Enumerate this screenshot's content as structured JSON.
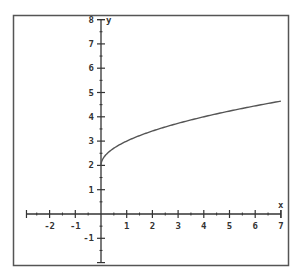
{
  "chart_data": {
    "type": "line",
    "title": "",
    "function": "y = sqrt(x) + 2",
    "xlabel": "x",
    "ylabel": "y",
    "xlim": [
      -2.9,
      7
    ],
    "ylim": [
      -2,
      8
    ],
    "x_ticks": [
      -2,
      -1,
      1,
      2,
      3,
      4,
      5,
      6,
      7
    ],
    "x_tick_labels": [
      "-2",
      "-1",
      "1",
      "2",
      "3",
      "4",
      "5",
      "6",
      "7"
    ],
    "y_ticks": [
      -1,
      1,
      2,
      3,
      4,
      5,
      6,
      7,
      8
    ],
    "y_tick_labels": [
      "-1",
      "1",
      "2",
      "3",
      "4",
      "5",
      "6",
      "7",
      "8"
    ],
    "minor_ticks_per_unit": 2,
    "grid": false,
    "legend": false,
    "series": [
      {
        "name": "f(x)",
        "x": [
          0,
          0.25,
          0.5,
          1,
          1.5,
          2,
          2.5,
          3,
          3.5,
          4,
          4.5,
          5,
          5.5,
          6,
          6.5,
          7
        ],
        "values": [
          2,
          2.5,
          2.71,
          3,
          3.22,
          3.41,
          3.58,
          3.73,
          3.87,
          4,
          4.12,
          4.24,
          4.35,
          4.45,
          4.55,
          4.65
        ]
      }
    ]
  },
  "colors": {
    "line": "#555555",
    "axis": "#333333",
    "frame": "#555555",
    "background": "#ffffff"
  }
}
